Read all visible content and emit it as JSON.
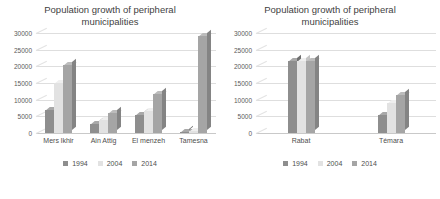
{
  "charts": [
    {
      "title": "Population growth of peripheral municipalities",
      "yticks": [
        "0",
        "5000",
        "10000",
        "15000",
        "20000",
        "25000",
        "30000"
      ],
      "categories": [
        "Mers lkhir",
        "Ain Attig",
        "El menzeh",
        "Tamesna"
      ],
      "legend": [
        "1994",
        "2004",
        "2014"
      ]
    },
    {
      "title": "Population growth of peripheral municipalities",
      "yticks": [
        "0",
        "5000",
        "10000",
        "15000",
        "20000",
        "25000",
        "30000"
      ],
      "categories": [
        "Rabat",
        "Témara"
      ],
      "legend": [
        "1994",
        "2004",
        "2014"
      ]
    }
  ],
  "chart_data": [
    {
      "type": "bar",
      "title": "Population growth of peripheral municipalities",
      "xlabel": "",
      "ylabel": "",
      "ylim": [
        0,
        30000
      ],
      "ytick_values": [
        0,
        5000,
        10000,
        15000,
        20000,
        25000,
        30000
      ],
      "grid": true,
      "legend_position": "bottom",
      "categories": [
        "Mers lkhir",
        "Ain Attig",
        "El menzeh",
        "Tamesna"
      ],
      "series": [
        {
          "name": "1994",
          "color": "#8e8e8e",
          "values": [
            7000,
            2800,
            5300,
            400
          ]
        },
        {
          "name": "2004",
          "color": "#e2e2e2",
          "values": [
            15000,
            3800,
            6600,
            500
          ]
        },
        {
          "name": "2014",
          "color": "#a5a5a5",
          "values": [
            20500,
            6000,
            11800,
            29000
          ]
        }
      ]
    },
    {
      "type": "bar",
      "title": "Population growth of peripheral municipalities",
      "xlabel": "",
      "ylabel": "",
      "ylim": [
        0,
        30000
      ],
      "ytick_values": [
        0,
        5000,
        10000,
        15000,
        20000,
        25000,
        30000
      ],
      "grid": true,
      "legend_position": "bottom",
      "categories": [
        "Rabat",
        "Témara"
      ],
      "series": [
        {
          "name": "1994",
          "color": "#8e8e8e",
          "values": [
            21500,
            5500
          ]
        },
        {
          "name": "2004",
          "color": "#e2e2e2",
          "values": [
            21500,
            9000
          ]
        },
        {
          "name": "2014",
          "color": "#a5a5a5",
          "values": [
            21500,
            11500
          ]
        }
      ]
    }
  ]
}
